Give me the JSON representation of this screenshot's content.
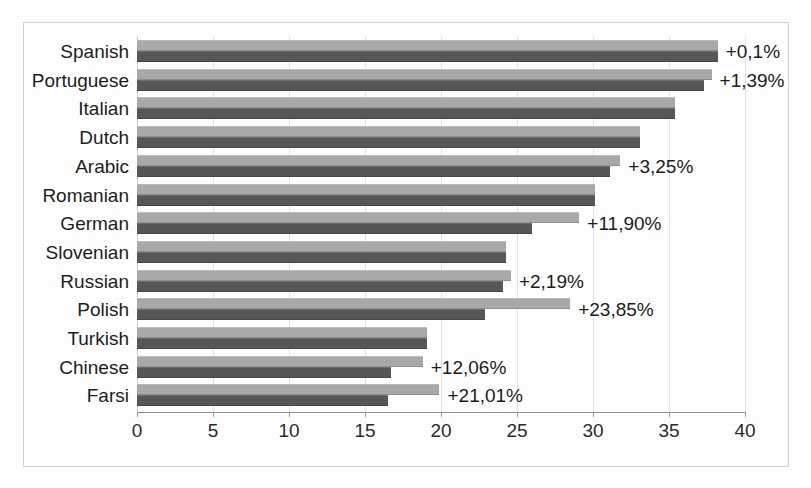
{
  "chart_data": {
    "type": "bar",
    "orientation": "horizontal",
    "title": "",
    "subtitle": "",
    "xlabel": "",
    "ylabel": "",
    "xlim": [
      0,
      40
    ],
    "ylim": null,
    "grid": true,
    "legend_position": "none",
    "tick_labels_x": [
      "0",
      "5",
      "10",
      "15",
      "20",
      "25",
      "30",
      "35",
      "40"
    ],
    "tick_values_x": [
      0,
      5,
      10,
      15,
      20,
      25,
      30,
      35,
      40
    ],
    "categories": [
      "Spanish",
      "Portuguese",
      "Italian",
      "Dutch",
      "Arabic",
      "Romanian",
      "German",
      "Slovenian",
      "Russian",
      "Polish",
      "Turkish",
      "Chinese",
      "Farsi"
    ],
    "series": [
      {
        "name": "current",
        "color": "#a9a9a9",
        "values": [
          38.2,
          37.8,
          35.4,
          33.1,
          31.8,
          30.1,
          29.1,
          24.3,
          24.6,
          28.5,
          19.1,
          18.8,
          19.9
        ]
      },
      {
        "name": "previous",
        "color": "#575757",
        "values": [
          38.2,
          37.3,
          35.4,
          33.1,
          31.1,
          30.1,
          26.0,
          24.3,
          24.1,
          22.9,
          19.1,
          16.7,
          16.5
        ]
      }
    ],
    "annotations": [
      {
        "category": "Spanish",
        "text": "+0,1%",
        "value": 38.2
      },
      {
        "category": "Portuguese",
        "text": "+1,39%",
        "value": 37.8
      },
      {
        "category": "Italian",
        "text": "",
        "value": 35.4
      },
      {
        "category": "Dutch",
        "text": "",
        "value": 33.1
      },
      {
        "category": "Arabic",
        "text": "+3,25%",
        "value": 31.8
      },
      {
        "category": "Romanian",
        "text": "",
        "value": 30.1
      },
      {
        "category": "German",
        "text": "+11,90%",
        "value": 29.1
      },
      {
        "category": "Slovenian",
        "text": "",
        "value": 24.3
      },
      {
        "category": "Russian",
        "text": "+2,19%",
        "value": 24.6
      },
      {
        "category": "Polish",
        "text": "+23,85%",
        "value": 28.5
      },
      {
        "category": "Turkish",
        "text": "",
        "value": 19.1
      },
      {
        "category": "Chinese",
        "text": "+12,06%",
        "value": 18.8
      },
      {
        "category": "Farsi",
        "text": "+21,01%",
        "value": 19.9
      }
    ]
  },
  "colors": {
    "bar_light": "#a9a9a9",
    "bar_dark": "#575757",
    "grid": "#e3e3e3",
    "frame": "#d2d2d2",
    "text": "#1d1d1d",
    "background": "#ffffff"
  }
}
